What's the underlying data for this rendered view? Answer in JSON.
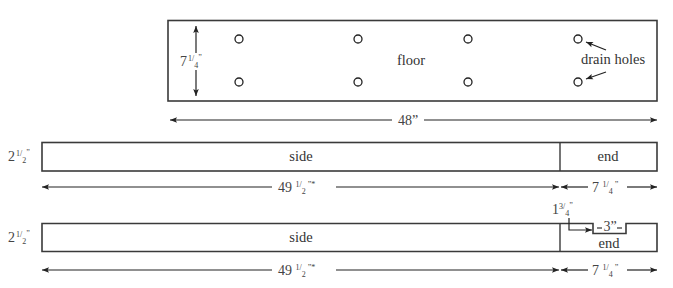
{
  "diagram": {
    "type": "woodworking-cut-plan",
    "floor": {
      "label": "floor",
      "height_dim": {
        "whole": "7",
        "num": "1",
        "den": "4",
        "unit": "”"
      },
      "length_dim": "48”",
      "annotation": "drain holes",
      "hole_count": 8
    },
    "board_1": {
      "height_dim": {
        "whole": "2",
        "num": "1",
        "den": "2",
        "unit": "”"
      },
      "side_label": "side",
      "end_label": "end",
      "side_length_dim": {
        "whole": "49 ",
        "num": "1",
        "den": "2",
        "unit": " ”*"
      },
      "end_length_dim": {
        "whole": "7 ",
        "num": "1",
        "den": "4",
        "unit": " ”"
      }
    },
    "board_2": {
      "height_dim": {
        "whole": "2",
        "num": "1",
        "den": "2",
        "unit": "”"
      },
      "side_label": "side",
      "end_label": "end",
      "notch_offset_dim": {
        "whole": "1",
        "num": "3",
        "den": "4",
        "unit": "”"
      },
      "notch_width_dim": "3”",
      "side_length_dim": {
        "whole": "49 ",
        "num": "1",
        "den": "2",
        "unit": " ”*"
      },
      "end_length_dim": {
        "whole": "7 ",
        "num": "1",
        "den": "4",
        "unit": " ”"
      }
    },
    "colors": {
      "line": "#3a3a3a",
      "text": "#333333",
      "background": "#ffffff"
    }
  }
}
